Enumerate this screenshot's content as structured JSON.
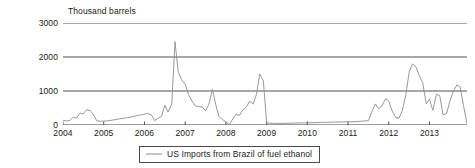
{
  "chart_data": {
    "type": "line",
    "title": "",
    "subtitle": "",
    "xlabel": "",
    "ylabel": "Thousand barrels",
    "ylim": [
      0,
      3000
    ],
    "xlim": [
      2004.0,
      2013.92
    ],
    "grid": true,
    "grid_axis": "y",
    "legend_position": "bottom-center",
    "y_ticks": [
      0,
      1000,
      2000,
      3000
    ],
    "y_tick_labels": [
      "0",
      "1000",
      "2000",
      "3000"
    ],
    "x_ticks": [
      2004,
      2005,
      2006,
      2007,
      2008,
      2009,
      2010,
      2011,
      2012,
      2013
    ],
    "x_tick_labels": [
      "2004",
      "2005",
      "2006",
      "2007",
      "2008",
      "2009",
      "2010",
      "2011",
      "2012",
      "2013"
    ],
    "series": [
      {
        "name": "US Imports from Brazil of fuel ethanol",
        "color": "#8c8c8c",
        "x": [
          2004.0,
          2004.08,
          2004.17,
          2004.25,
          2004.33,
          2004.42,
          2004.5,
          2004.58,
          2004.67,
          2004.75,
          2004.83,
          2004.92,
          2005.0,
          2005.08,
          2005.17,
          2005.25,
          2005.33,
          2005.42,
          2005.5,
          2005.58,
          2005.67,
          2005.75,
          2005.83,
          2005.92,
          2006.0,
          2006.08,
          2006.17,
          2006.25,
          2006.33,
          2006.42,
          2006.5,
          2006.58,
          2006.67,
          2006.75,
          2006.83,
          2006.92,
          2007.0,
          2007.08,
          2007.17,
          2007.25,
          2007.33,
          2007.42,
          2007.5,
          2007.58,
          2007.67,
          2007.75,
          2007.83,
          2007.92,
          2008.0,
          2008.08,
          2008.17,
          2008.25,
          2008.33,
          2008.42,
          2008.5,
          2008.58,
          2008.67,
          2008.75,
          2008.83,
          2008.92,
          2009.0,
          2009.17,
          2009.33,
          2009.5,
          2009.67,
          2009.83,
          2010.0,
          2010.17,
          2010.33,
          2010.5,
          2010.67,
          2010.83,
          2011.0,
          2011.17,
          2011.33,
          2011.5,
          2011.58,
          2011.67,
          2011.75,
          2011.83,
          2011.92,
          2012.0,
          2012.08,
          2012.17,
          2012.25,
          2012.33,
          2012.42,
          2012.5,
          2012.58,
          2012.67,
          2012.75,
          2012.83,
          2012.92,
          2013.0,
          2013.08,
          2013.17,
          2013.25,
          2013.33,
          2013.42,
          2013.5,
          2013.58,
          2013.67,
          2013.75,
          2013.83,
          2013.92
        ],
        "values": [
          140,
          120,
          130,
          230,
          200,
          350,
          330,
          450,
          420,
          300,
          120,
          110,
          115,
          120,
          135,
          150,
          170,
          185,
          200,
          215,
          235,
          255,
          280,
          300,
          320,
          340,
          300,
          130,
          190,
          260,
          580,
          380,
          620,
          2450,
          1550,
          1320,
          1200,
          900,
          700,
          560,
          540,
          530,
          420,
          600,
          1050,
          600,
          250,
          160,
          90,
          10,
          180,
          320,
          280,
          450,
          520,
          700,
          620,
          900,
          1500,
          1300,
          60,
          50,
          45,
          50,
          55,
          60,
          65,
          70,
          75,
          80,
          85,
          90,
          95,
          100,
          110,
          130,
          380,
          620,
          480,
          560,
          770,
          700,
          420,
          220,
          200,
          420,
          900,
          1560,
          1800,
          1700,
          1450,
          1250,
          620,
          760,
          430,
          900,
          870,
          300,
          340,
          700,
          980,
          1180,
          1120,
          600,
          40
        ]
      }
    ]
  },
  "legend": {
    "entries": [
      {
        "label": "US Imports from Brazil of fuel ethanol",
        "color": "#8c8c8c"
      }
    ]
  },
  "axis": {
    "unit_label": "Thousand barrels"
  },
  "colors": {
    "line": "#8c8c8c",
    "grid": "#3c3c3c",
    "axis": "#3c3c3c",
    "text": "#1a1a1a",
    "background": "#ffffff"
  }
}
